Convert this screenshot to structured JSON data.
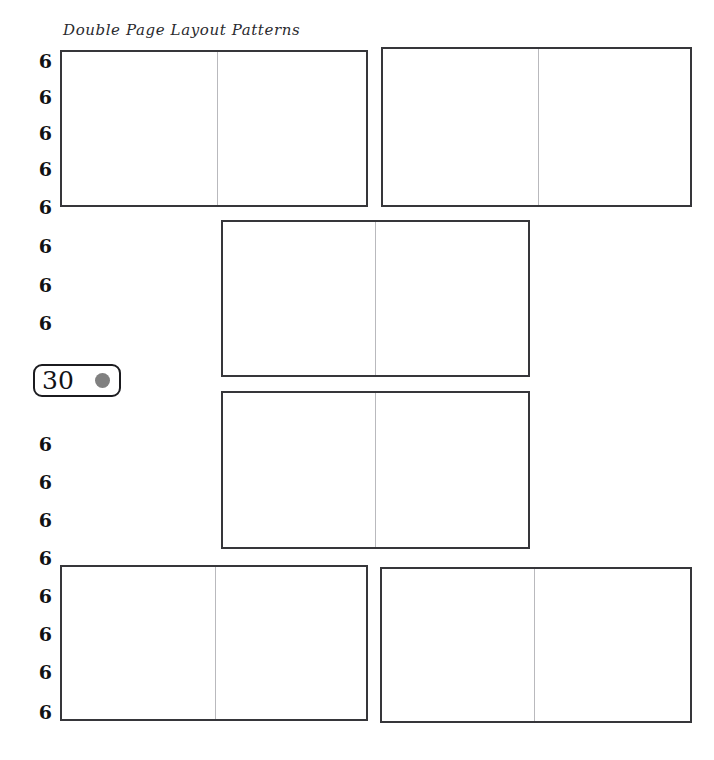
{
  "page": {
    "width": 714,
    "height": 760,
    "background": "#ffffff",
    "title": "Double Page Layout Patterns",
    "title_color": "#2a2a2e"
  },
  "ghost_strip": {
    "fragments": [
      "",
      "",
      "",
      "",
      "",
      "",
      ""
    ],
    "color": "#fbfbfc"
  },
  "ruler": {
    "label": "6",
    "color": "#111114",
    "ticks": [
      {
        "value": "6",
        "top": 52
      },
      {
        "value": "6",
        "top": 88
      },
      {
        "value": "6",
        "top": 124
      },
      {
        "value": "6",
        "top": 160
      },
      {
        "value": "6",
        "top": 198
      },
      {
        "value": "6",
        "top": 237
      },
      {
        "value": "6",
        "top": 276
      },
      {
        "value": "6",
        "top": 314
      },
      {
        "value": "6",
        "top": 435
      },
      {
        "value": "6",
        "top": 473
      },
      {
        "value": "6",
        "top": 511
      },
      {
        "value": "6",
        "top": 549
      },
      {
        "value": "6",
        "top": 587
      },
      {
        "value": "6",
        "top": 625
      },
      {
        "value": "6",
        "top": 663
      },
      {
        "value": "6",
        "top": 703
      }
    ]
  },
  "badge": {
    "value": "30",
    "dot_color": "#808080",
    "border_color": "#1b1b1f"
  },
  "spreads": {
    "border_color": "#36363a",
    "gutter_color": "#b9b9bd",
    "items": [
      {
        "name": "spread-top-left",
        "left": 60,
        "top": 50,
        "width": 308,
        "height": 157,
        "gutter": 155
      },
      {
        "name": "spread-top-right",
        "left": 381,
        "top": 47,
        "width": 311,
        "height": 160,
        "gutter": 155
      },
      {
        "name": "spread-middle-upper",
        "left": 221,
        "top": 220,
        "width": 309,
        "height": 157,
        "gutter": 152
      },
      {
        "name": "spread-middle-lower",
        "left": 221,
        "top": 391,
        "width": 309,
        "height": 158,
        "gutter": 152
      },
      {
        "name": "spread-bottom-left",
        "left": 60,
        "top": 565,
        "width": 308,
        "height": 156,
        "gutter": 153
      },
      {
        "name": "spread-bottom-right",
        "left": 380,
        "top": 567,
        "width": 312,
        "height": 156,
        "gutter": 152
      }
    ]
  }
}
